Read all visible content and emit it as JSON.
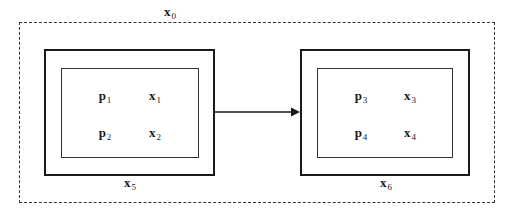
{
  "diagram": {
    "outer_container": {
      "label": {
        "base": "x",
        "sub": "0"
      }
    },
    "left_block": {
      "label": {
        "base": "x",
        "sub": "5"
      },
      "cells": [
        {
          "base": "p",
          "sub": "1"
        },
        {
          "base": "x",
          "sub": "1"
        },
        {
          "base": "p",
          "sub": "2"
        },
        {
          "base": "x",
          "sub": "2"
        }
      ]
    },
    "right_block": {
      "label": {
        "base": "x",
        "sub": "6"
      },
      "cells": [
        {
          "base": "p",
          "sub": "3"
        },
        {
          "base": "x",
          "sub": "3"
        },
        {
          "base": "p",
          "sub": "4"
        },
        {
          "base": "x",
          "sub": "4"
        }
      ]
    },
    "edges": [
      {
        "from": "left_block",
        "to": "right_block",
        "style": "solid-arrow"
      }
    ],
    "colors": {
      "stroke": "#1a1a1a",
      "background": "#ffffff"
    }
  }
}
